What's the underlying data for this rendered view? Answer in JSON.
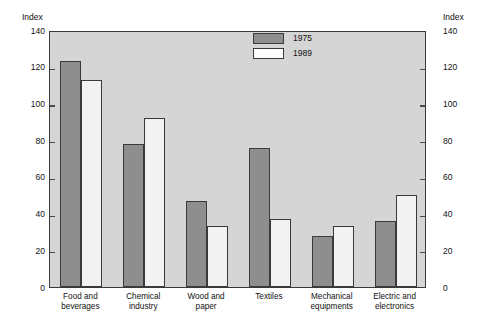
{
  "title_remnant": "",
  "axis": {
    "unit_label_left": "Index",
    "unit_label_right": "Index"
  },
  "legend": {
    "items": [
      {
        "label": "1975",
        "style": "filled-dark",
        "color": "#8e8e8e"
      },
      {
        "label": "1989",
        "style": "filled-white",
        "color": "#fdfdfd"
      }
    ]
  },
  "chart_data": {
    "type": "bar",
    "title": "",
    "xlabel": "",
    "ylabel": "Index",
    "ylim": [
      0,
      140
    ],
    "yticks": [
      0,
      20,
      40,
      60,
      80,
      100,
      120,
      140
    ],
    "ytick_labels": [
      "0",
      "20",
      "40",
      "60",
      "80",
      "100",
      "120",
      "140"
    ],
    "grid": false,
    "legend_position": "top-center",
    "dual_axis": true,
    "categories": [
      "Food and beverages",
      "Chemical industry",
      "Wood and paper",
      "Textiles",
      "Mechanical equipments",
      "Electric and electronics"
    ],
    "category_lines": [
      [
        "Food and",
        "beverages"
      ],
      [
        "Chemical",
        "industry"
      ],
      [
        "Wood and",
        "paper"
      ],
      [
        "Textiles"
      ],
      [
        "Mechanical",
        "equipments"
      ],
      [
        "Electric and",
        "electronics"
      ]
    ],
    "series": [
      {
        "name": "1975",
        "color": "#8e8e8e",
        "values": [
          123,
          78,
          47,
          76,
          28,
          36
        ]
      },
      {
        "name": "1989",
        "color": "#fdfdfd",
        "values": [
          113,
          92,
          33,
          37,
          33,
          50
        ]
      }
    ]
  }
}
